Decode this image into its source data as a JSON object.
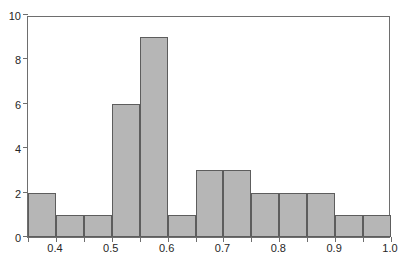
{
  "chart_data": {
    "type": "bar",
    "title": "",
    "subtitle": "",
    "xlabel": "",
    "ylabel": "",
    "xlim": [
      0.35,
      1.0
    ],
    "ylim": [
      0,
      10
    ],
    "grid": false,
    "legend": null,
    "bin_width": 0.05,
    "bin_edges": [
      0.35,
      0.4,
      0.45,
      0.5,
      0.55,
      0.6,
      0.65,
      0.7,
      0.75,
      0.8,
      0.85,
      0.9,
      0.95,
      1.0
    ],
    "categories": [
      "0.35-0.40",
      "0.40-0.45",
      "0.45-0.50",
      "0.50-0.55",
      "0.55-0.60",
      "0.60-0.65",
      "0.65-0.70",
      "0.70-0.75",
      "0.75-0.80",
      "0.80-0.85",
      "0.85-0.90",
      "0.90-0.95",
      "0.95-1.00"
    ],
    "values": [
      2,
      1,
      1,
      6,
      9,
      1,
      3,
      3,
      2,
      2,
      2,
      1,
      1
    ],
    "x_tick_labels": [
      "0.4",
      "0.5",
      "0.6",
      "0.7",
      "0.8",
      "0.9",
      "1.0"
    ],
    "x_tick_values": [
      0.4,
      0.5,
      0.6,
      0.7,
      0.8,
      0.9,
      1.0
    ],
    "x_minor_tick_values": [
      0.35,
      0.45,
      0.55,
      0.65,
      0.75,
      0.85,
      0.95
    ],
    "y_tick_labels": [
      "0",
      "2",
      "4",
      "6",
      "8",
      "10"
    ],
    "y_tick_values": [
      0,
      2,
      4,
      6,
      8,
      10
    ],
    "colors": {
      "bar_fill": "#b6b6b6",
      "bar_stroke": "#5d5d5d",
      "axis": "#6e6e6e",
      "text": "#262626",
      "background": "#ffffff"
    }
  }
}
